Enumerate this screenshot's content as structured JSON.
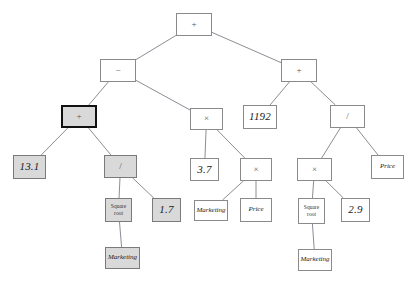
{
  "diagram": {
    "type": "expression-tree",
    "canvas": {
      "width": 416,
      "height": 293,
      "background": "#ffffff"
    },
    "styles": {
      "node_fill_default": "#ffffff",
      "node_fill_highlight": "#d9d9d9",
      "node_border": "#8a8a8a",
      "node_border_selected": "#111111",
      "edge_color": "#7f7f8a"
    },
    "nodes": [
      {
        "id": "n0",
        "label": "+",
        "kind": "op",
        "x": 176,
        "y": 13,
        "w": 36,
        "h": 23,
        "fill": "white",
        "selected": false
      },
      {
        "id": "n1",
        "label": "−",
        "kind": "op",
        "x": 100,
        "y": 59,
        "w": 36,
        "h": 23,
        "fill": "white",
        "selected": false
      },
      {
        "id": "n2",
        "label": "+",
        "kind": "op",
        "x": 281,
        "y": 59,
        "w": 36,
        "h": 23,
        "fill": "white",
        "selected": false
      },
      {
        "id": "n3",
        "label": "+",
        "kind": "op",
        "x": 61,
        "y": 105,
        "w": 36,
        "h": 23,
        "fill": "gray",
        "selected": true
      },
      {
        "id": "n4",
        "label": "×",
        "kind": "op",
        "x": 190,
        "y": 108,
        "w": 33,
        "h": 22,
        "fill": "white",
        "selected": false
      },
      {
        "id": "n5",
        "label": "1192",
        "kind": "val",
        "x": 243,
        "y": 105,
        "w": 34,
        "h": 24,
        "fill": "white",
        "selected": false
      },
      {
        "id": "n6",
        "label": "/",
        "kind": "op",
        "x": 330,
        "y": 105,
        "w": 35,
        "h": 23,
        "fill": "white",
        "selected": false
      },
      {
        "id": "n7",
        "label": "13.1",
        "kind": "val",
        "x": 13,
        "y": 155,
        "w": 33,
        "h": 24,
        "fill": "gray",
        "selected": false
      },
      {
        "id": "n8",
        "label": "/",
        "kind": "op",
        "x": 104,
        "y": 155,
        "w": 33,
        "h": 23,
        "fill": "gray",
        "selected": false
      },
      {
        "id": "n9",
        "label": "3.7",
        "kind": "val",
        "x": 190,
        "y": 158,
        "w": 29,
        "h": 23,
        "fill": "white",
        "selected": false
      },
      {
        "id": "n10",
        "label": "×",
        "kind": "op",
        "x": 240,
        "y": 158,
        "w": 32,
        "h": 23,
        "fill": "white",
        "selected": false
      },
      {
        "id": "n11",
        "label": "×",
        "kind": "op",
        "x": 297,
        "y": 158,
        "w": 35,
        "h": 23,
        "fill": "white",
        "selected": false
      },
      {
        "id": "n12",
        "label": "Price",
        "kind": "var",
        "x": 371,
        "y": 155,
        "w": 33,
        "h": 24,
        "fill": "white",
        "selected": false
      },
      {
        "id": "n13",
        "label": "Square root",
        "kind": "fn",
        "x": 105,
        "y": 198,
        "w": 27,
        "h": 24,
        "fill": "gray",
        "selected": false
      },
      {
        "id": "n14",
        "label": "1.7",
        "kind": "val",
        "x": 152,
        "y": 198,
        "w": 29,
        "h": 24,
        "fill": "gray",
        "selected": false
      },
      {
        "id": "n15",
        "label": "Marketing",
        "kind": "var",
        "x": 194,
        "y": 200,
        "w": 34,
        "h": 21,
        "fill": "white",
        "selected": false
      },
      {
        "id": "n16",
        "label": "Price",
        "kind": "var",
        "x": 240,
        "y": 198,
        "w": 32,
        "h": 24,
        "fill": "white",
        "selected": false
      },
      {
        "id": "n17",
        "label": "Square root",
        "kind": "fn",
        "x": 298,
        "y": 198,
        "w": 27,
        "h": 26,
        "fill": "white",
        "selected": false
      },
      {
        "id": "n18",
        "label": "2.9",
        "kind": "val",
        "x": 341,
        "y": 198,
        "w": 29,
        "h": 24,
        "fill": "white",
        "selected": false
      },
      {
        "id": "n19",
        "label": "Marketing",
        "kind": "var",
        "x": 105,
        "y": 247,
        "w": 35,
        "h": 22,
        "fill": "gray",
        "selected": false
      },
      {
        "id": "n20",
        "label": "Marketing",
        "kind": "var",
        "x": 298,
        "y": 249,
        "w": 34,
        "h": 22,
        "fill": "white",
        "selected": false
      }
    ],
    "edges": [
      {
        "from": "n0",
        "to": "n1"
      },
      {
        "from": "n0",
        "to": "n2"
      },
      {
        "from": "n1",
        "to": "n3"
      },
      {
        "from": "n1",
        "to": "n4"
      },
      {
        "from": "n2",
        "to": "n5"
      },
      {
        "from": "n2",
        "to": "n6"
      },
      {
        "from": "n3",
        "to": "n7"
      },
      {
        "from": "n3",
        "to": "n8"
      },
      {
        "from": "n4",
        "to": "n9"
      },
      {
        "from": "n4",
        "to": "n10"
      },
      {
        "from": "n6",
        "to": "n11"
      },
      {
        "from": "n6",
        "to": "n12"
      },
      {
        "from": "n8",
        "to": "n13"
      },
      {
        "from": "n8",
        "to": "n14"
      },
      {
        "from": "n10",
        "to": "n15"
      },
      {
        "from": "n10",
        "to": "n16"
      },
      {
        "from": "n11",
        "to": "n17"
      },
      {
        "from": "n11",
        "to": "n18"
      },
      {
        "from": "n13",
        "to": "n19"
      },
      {
        "from": "n17",
        "to": "n20"
      }
    ]
  }
}
